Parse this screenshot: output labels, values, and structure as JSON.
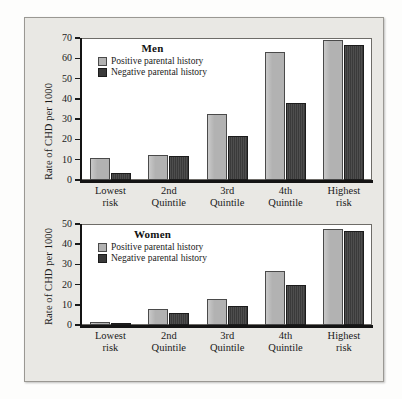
{
  "figure": {
    "background_color": "#e9e8e4",
    "positive_color": "#b2b2b2",
    "negative_color": "#3a3a3a"
  },
  "chart_data": [
    {
      "type": "bar",
      "title": "Men",
      "xlabel": "",
      "ylabel": "Rate of CHD per 1000",
      "ylim": [
        0,
        70
      ],
      "yticks": [
        0,
        10,
        20,
        30,
        40,
        50,
        60,
        70
      ],
      "grid": false,
      "legend_position": "upper-left-inside",
      "categories": [
        "Lowest\nrisk",
        "2nd\nQuintile",
        "3rd\nQuintile",
        "4th\nQuintile",
        "Highest\nrisk"
      ],
      "series": [
        {
          "name": "Positive parental history",
          "color": "#b2b2b2",
          "values": [
            11,
            12.5,
            32.5,
            63,
            69
          ]
        },
        {
          "name": "Negative parental history",
          "color": "#3a3a3a",
          "values": [
            3.5,
            12,
            21.5,
            38,
            66.5
          ]
        }
      ]
    },
    {
      "type": "bar",
      "title": "Women",
      "xlabel": "",
      "ylabel": "Rate of CHD per 1000",
      "ylim": [
        0,
        50
      ],
      "yticks": [
        0,
        10,
        20,
        30,
        40,
        50
      ],
      "grid": false,
      "legend_position": "upper-left-inside",
      "categories": [
        "Lowest\nrisk",
        "2nd\nQuintile",
        "3rd\nQuintile",
        "4th\nQuintile",
        "Highest\nrisk"
      ],
      "series": [
        {
          "name": "Positive parental history",
          "color": "#b2b2b2",
          "values": [
            1.3,
            7.8,
            12.7,
            26.5,
            47.5
          ]
        },
        {
          "name": "Negative parental history",
          "color": "#3a3a3a",
          "values": [
            1,
            5.7,
            9.5,
            20,
            46.5
          ]
        }
      ]
    }
  ]
}
